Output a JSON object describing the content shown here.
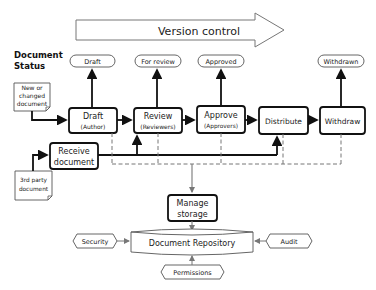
{
  "diagram": {
    "banner": {
      "label": "Version control"
    },
    "status_heading": {
      "line1": "Document",
      "line2": "Status"
    },
    "statuses": [
      {
        "id": "draft",
        "label": "Draft"
      },
      {
        "id": "review",
        "label": "For review"
      },
      {
        "id": "approved",
        "label": "Approved"
      },
      {
        "id": "withdrawn",
        "label": "Withdrawn"
      }
    ],
    "process_steps": [
      {
        "id": "draft",
        "line1": "Draft",
        "line2": "(Author)"
      },
      {
        "id": "review",
        "line1": "Review",
        "line2": "(Reviewers)"
      },
      {
        "id": "approve",
        "line1": "Approve",
        "line2": "(Approvers)"
      },
      {
        "id": "distribute",
        "line1": "Distribute",
        "line2": ""
      },
      {
        "id": "withdraw",
        "line1": "Withdraw",
        "line2": ""
      }
    ],
    "receive": {
      "line1": "Receive",
      "line2": "document"
    },
    "inputs": {
      "new_doc": {
        "line1": "New or",
        "line2": "changed",
        "line3": "document"
      },
      "third_party": {
        "line1": "3rd party",
        "line2": "document"
      }
    },
    "manage_storage": {
      "line1": "Manage",
      "line2": "storage"
    },
    "repository": {
      "label": "Document Repository"
    },
    "controls": {
      "security": "Security",
      "audit": "Audit",
      "permissions": "Permissions"
    }
  }
}
